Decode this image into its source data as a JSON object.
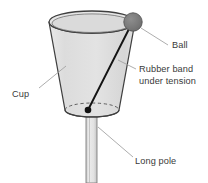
{
  "figure": {
    "type": "labeled-physics-diagram",
    "background_color": "#ffffff"
  },
  "colors": {
    "outline": "#3f3f3f",
    "cup_fill": "#dedede",
    "cup_fill_light": "#e8e8e8",
    "ball_fill": "#7a7a7a",
    "ball_outline": "#4a4a4a",
    "pole_fill": "#e0e0e0",
    "band_color": "#1a1a1a",
    "leader_line": "#9a9a9a",
    "text": "#3a3a3a"
  },
  "objects": {
    "cup": {
      "name": "Cup",
      "rim_center_x": 92,
      "rim_center_y": 22,
      "rim_rx": 43,
      "rim_ry": 11,
      "base_center_x": 92,
      "base_center_y": 110,
      "base_rx": 27,
      "base_ry": 7
    },
    "ball": {
      "name": "Ball",
      "cx": 133,
      "cy": 22,
      "r": 9
    },
    "rubber_band": {
      "name": "Rubber band under tension",
      "x1": 131,
      "y1": 25,
      "x2": 88,
      "y2": 110,
      "anchor_r": 3.2
    },
    "pole": {
      "name": "Long pole",
      "x": 86,
      "y": 110,
      "width": 11,
      "height": 73
    }
  },
  "labels": [
    {
      "id": "ball",
      "text": "Ball",
      "x": 172,
      "y": 48,
      "anchor": "start",
      "leader": {
        "x1": 141,
        "y1": 28,
        "x2": 168,
        "y2": 45
      }
    },
    {
      "id": "rubber-band",
      "text_line1": "Rubber band",
      "text_line2": "under tension",
      "x": 139,
      "y1": 72,
      "y2": 84,
      "anchor": "start",
      "leader": {
        "x1": 118,
        "y1": 60,
        "x2": 136,
        "y2": 69
      }
    },
    {
      "id": "cup",
      "text": "Cup",
      "x": 12,
      "y": 97,
      "anchor": "start",
      "leader": {
        "x1": 39,
        "y1": 88,
        "x2": 66,
        "y2": 66
      }
    },
    {
      "id": "long-pole",
      "text": "Long pole",
      "x": 135,
      "y": 164,
      "anchor": "start",
      "leader": {
        "x1": 98,
        "y1": 127,
        "x2": 133,
        "y2": 157
      }
    }
  ]
}
